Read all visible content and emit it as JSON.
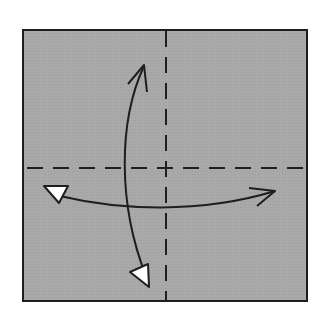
{
  "diagram": {
    "type": "origami-fold-diagram",
    "description": "Square paper with valley-fold crease lines through center; unfold arrows horizontally and vertically",
    "colors": {
      "paper": "#a9a9a9",
      "outline": "#1e1e1e",
      "crease": "#1e1e1e",
      "arrow": "#1e1e1e",
      "arrowhead_fill": "#ffffff",
      "background": "#ffffff"
    },
    "paper": {
      "x": 23,
      "y": 30,
      "width": 284,
      "height": 271
    },
    "creases": [
      {
        "id": "vertical-crease",
        "style": "dashed",
        "x1": 166,
        "y1": 30,
        "x2": 166,
        "y2": 301
      },
      {
        "id": "horizontal-crease",
        "style": "dashed",
        "x1": 26,
        "y1": 168,
        "x2": 304,
        "y2": 168
      }
    ],
    "arrows": [
      {
        "id": "vertical-arrow",
        "from": "bottom-white-triangle",
        "to": "top-open-head",
        "path": "M146,276 C120,200 122,120 144,66"
      },
      {
        "id": "horizontal-arrow",
        "from": "left-white-triangle",
        "to": "right-open-head",
        "path": "M58,196 C120,212 200,214 274,192"
      }
    ]
  }
}
